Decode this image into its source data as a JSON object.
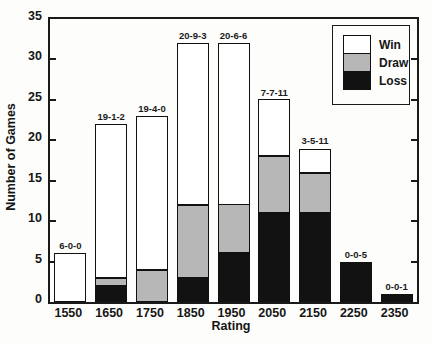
{
  "chart_data": {
    "type": "bar",
    "stacked": true,
    "title": "",
    "xlabel": "Rating",
    "ylabel": "Number of Games",
    "categories": [
      "1550",
      "1650",
      "1750",
      "1850",
      "1950",
      "2050",
      "2150",
      "2250",
      "2350"
    ],
    "series": [
      {
        "name": "Win",
        "color": "#ffffff",
        "values": [
          6,
          19,
          19,
          20,
          20,
          7,
          3,
          0,
          0
        ]
      },
      {
        "name": "Draw",
        "color": "#b7b7b7",
        "values": [
          0,
          1,
          4,
          9,
          6,
          7,
          5,
          0,
          0
        ]
      },
      {
        "name": "Loss",
        "color": "#121212",
        "values": [
          0,
          2,
          0,
          3,
          6,
          11,
          11,
          5,
          1
        ]
      }
    ],
    "stack_order": [
      "Loss",
      "Draw",
      "Win"
    ],
    "bar_labels": [
      "6-0-0",
      "19-1-2",
      "19-4-0",
      "20-9-3",
      "20-6-6",
      "7-7-11",
      "3-5-11",
      "0-0-5",
      "0-0-1"
    ],
    "ylim": [
      0,
      35
    ],
    "yticks": [
      0,
      5,
      10,
      15,
      20,
      25,
      30,
      35
    ],
    "grid": false,
    "legend": {
      "position": "top-right",
      "entries": [
        "Win",
        "Draw",
        "Loss"
      ]
    },
    "colors": {
      "axis": "#1a1a1a",
      "win": "#ffffff",
      "draw": "#b7b7b7",
      "loss": "#121212"
    }
  }
}
